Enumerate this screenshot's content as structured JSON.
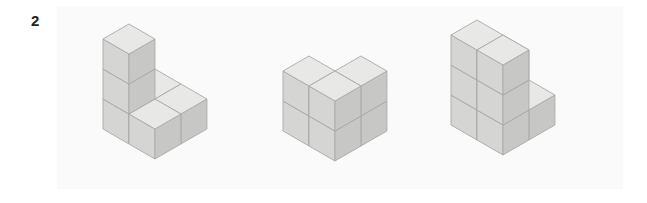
{
  "question": {
    "number": "2"
  },
  "panel": {
    "background_color": "#fafafa",
    "page_background_color": "#ffffff"
  },
  "palette": {
    "face_top": "#e8e8e6",
    "face_left": "#d5d5d3",
    "face_right": "#c7c7c5",
    "edge_stroke": "#a9a9a7",
    "label_color": "#231f20"
  },
  "figures": [
    {
      "name": "figure-1",
      "label": "Figure 1",
      "description": "Staircase arrangement of unit cubes",
      "cube_count": 6,
      "cubes": [
        {
          "x": 0,
          "y": 0,
          "z": 0
        },
        {
          "x": 1,
          "y": 0,
          "z": 0
        },
        {
          "x": 0,
          "y": 1,
          "z": 0
        },
        {
          "x": 1,
          "y": 1,
          "z": 0
        },
        {
          "x": 0,
          "y": 1,
          "z": 1
        },
        {
          "x": 0,
          "y": 1,
          "z": 2
        }
      ],
      "origin": {
        "left": 44,
        "top": 16
      },
      "cube_size": 30
    },
    {
      "name": "figure-2",
      "label": "Figure 2",
      "description": "Two-by-two-by-two block with the front top cube removed",
      "cube_count": 7,
      "cubes": [
        {
          "x": 0,
          "y": 0,
          "z": 0
        },
        {
          "x": 1,
          "y": 0,
          "z": 0
        },
        {
          "x": 0,
          "y": 1,
          "z": 0
        },
        {
          "x": 1,
          "y": 1,
          "z": 0
        },
        {
          "x": 1,
          "y": 0,
          "z": 1
        },
        {
          "x": 0,
          "y": 1,
          "z": 1
        },
        {
          "x": 1,
          "y": 1,
          "z": 1
        }
      ],
      "origin": {
        "left": 224,
        "top": 48
      },
      "cube_size": 30
    },
    {
      "name": "figure-3",
      "label": "Figure 3",
      "description": "Two-by-two base, three levels tall with stepped top",
      "cube_count": 9,
      "cubes": [
        {
          "x": 0,
          "y": 0,
          "z": 0
        },
        {
          "x": 1,
          "y": 0,
          "z": 0
        },
        {
          "x": 0,
          "y": 1,
          "z": 0
        },
        {
          "x": 1,
          "y": 1,
          "z": 0
        },
        {
          "x": 0,
          "y": 0,
          "z": 1
        },
        {
          "x": 0,
          "y": 1,
          "z": 1
        },
        {
          "x": 1,
          "y": 1,
          "z": 1
        },
        {
          "x": 0,
          "y": 1,
          "z": 2
        },
        {
          "x": 1,
          "y": 1,
          "z": 2
        }
      ],
      "origin": {
        "left": 392,
        "top": 12
      },
      "cube_size": 30
    }
  ]
}
